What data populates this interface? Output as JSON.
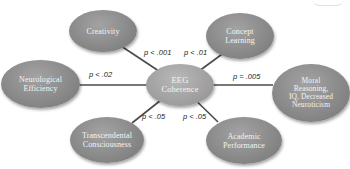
{
  "diagram": {
    "type": "hub-and-spoke",
    "center": {
      "label": "EEG\nCoherence"
    },
    "nodes": [
      {
        "id": "creativity",
        "label": "Creativity",
        "p": "p < .001"
      },
      {
        "id": "concept-learning",
        "label": "Concept\nLearning",
        "p": "p < .01"
      },
      {
        "id": "neurological-efficiency",
        "label": "Neurological\nEfficiency",
        "p": "p < .02"
      },
      {
        "id": "moral-reasoning",
        "label": "Moral\nReasoning,\nIQ, Decreased\nNeuroticism",
        "p": "p = .005"
      },
      {
        "id": "transcendental-consciousness",
        "label": "Transcendental\nConsciousness",
        "p": "p < .05"
      },
      {
        "id": "academic-performance",
        "label": "Academic\nPerformance",
        "p": "p < .05"
      }
    ],
    "colors": {
      "node": "#8a8a8a",
      "node_text": "#f4f4f4",
      "line": "#4a4a4a",
      "label_text": "#222222"
    }
  }
}
